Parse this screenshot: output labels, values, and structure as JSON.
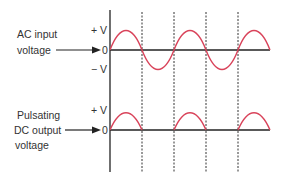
{
  "top_panel": {
    "label_line1": "AC input",
    "label_line2": "voltage",
    "plus_v": "+ V",
    "zero": "0",
    "minus_v": "− V"
  },
  "bottom_panel": {
    "label_line1": "Pulsating",
    "label_line2": "DC output",
    "label_line3": "voltage",
    "plus_v": "+ V",
    "zero": "0"
  },
  "colors": {
    "waveform": "#d9435a",
    "axis": "#222222",
    "text": "#333333"
  },
  "waveforms": {
    "ac_input": "full sine wave, 2 cycles",
    "dc_output": "half-wave rectified, positive halves only"
  }
}
